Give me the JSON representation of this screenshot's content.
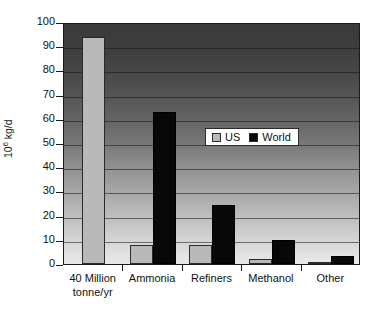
{
  "chart_data": {
    "type": "bar",
    "title": "",
    "subtitle": "",
    "xlabel": "",
    "ylabel": "10⁶ kg/d",
    "ylabel_base": "10",
    "ylabel_exp": "6",
    "ylabel_unit": " kg/d",
    "categories": [
      "40 Million tonne/yr",
      "Ammonia",
      "Refiners",
      "Methanol",
      "Other"
    ],
    "category_lines": [
      [
        "40 Million",
        "tonne/yr"
      ],
      [
        "Ammonia"
      ],
      [
        "Refiners"
      ],
      [
        "Methanol"
      ],
      [
        "Other"
      ]
    ],
    "series": [
      {
        "name": "US",
        "color": "#b9b9b9",
        "values": [
          94,
          8,
          8,
          2,
          1
        ]
      },
      {
        "name": "World",
        "color": "#080808",
        "values": [
          0,
          63,
          24.5,
          10,
          3.5
        ]
      }
    ],
    "ylim": [
      0,
      100
    ],
    "ytick_values": [
      0,
      10,
      20,
      30,
      40,
      50,
      60,
      70,
      80,
      90,
      100
    ],
    "ytick_labels": [
      "0",
      "10",
      "20",
      "30",
      "40",
      "50",
      "60",
      "70",
      "80",
      "90",
      "100"
    ],
    "grid": true,
    "grid_axis": "y",
    "legend": {
      "position": "inside-upper-right",
      "entries": [
        {
          "label": "US",
          "swatch": "light-gray"
        },
        {
          "label": "World",
          "swatch": "black"
        }
      ]
    },
    "plot_background": "vertical-gradient-dark-top-to-light-bottom"
  }
}
